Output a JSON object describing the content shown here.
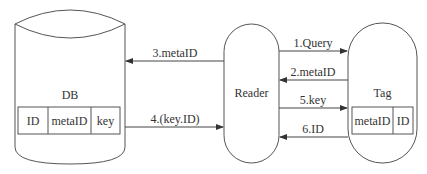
{
  "diagram": {
    "nodes": {
      "db": {
        "label": "DB",
        "table": [
          "ID",
          "metaID",
          "key"
        ]
      },
      "reader": {
        "label": "Reader"
      },
      "tag": {
        "label": "Tag",
        "table": [
          "metaID",
          "ID"
        ]
      }
    },
    "edges": [
      {
        "id": "e1",
        "label": "1.Query",
        "from": "Reader",
        "to": "Tag"
      },
      {
        "id": "e2",
        "label": "2.metaID",
        "from": "Tag",
        "to": "Reader"
      },
      {
        "id": "e3",
        "label": "3.metaID",
        "from": "Reader",
        "to": "DB"
      },
      {
        "id": "e4",
        "label": "4.(key.ID)",
        "from": "DB",
        "to": "Reader"
      },
      {
        "id": "e5",
        "label": "5.key",
        "from": "Reader",
        "to": "Tag"
      },
      {
        "id": "e6",
        "label": "6.ID",
        "from": "Tag",
        "to": "Reader"
      }
    ],
    "stroke_color": "#444444"
  }
}
